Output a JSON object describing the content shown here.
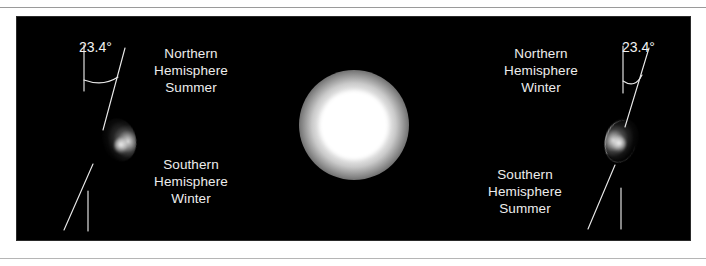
{
  "diagram": {
    "background_color": "#000000",
    "frame_color": "#ffffff",
    "text_color": "#ededed",
    "sun": {
      "name": "Sun",
      "color": "#ffffff",
      "center_x": 337,
      "center_y": 108
    },
    "left_position": {
      "earth_name": "Earth",
      "axial_tilt": "23.4°",
      "northern_label": "Northern\nHemisphere\nSummer",
      "northern_line1": "Northern",
      "northern_line2": "Hemisphere",
      "northern_line3": "Summer",
      "southern_line1": "Southern",
      "southern_line2": "Hemisphere",
      "southern_line3": "Winter"
    },
    "right_position": {
      "earth_name": "Earth",
      "axial_tilt": "23.4°",
      "northern_line1": "Northern",
      "northern_line2": "Hemisphere",
      "northern_line3": "Winter",
      "southern_line1": "Southern",
      "southern_line2": "Hemisphere",
      "southern_line3": "Summer"
    }
  }
}
